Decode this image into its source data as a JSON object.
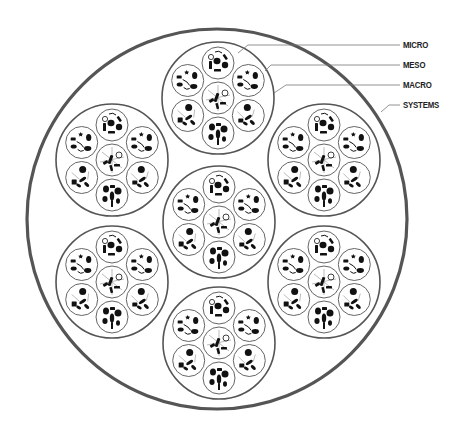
{
  "diagram": {
    "colors": {
      "systems_stroke": "#555555",
      "macro_stroke": "#555555",
      "micro_stroke": "#666666",
      "leader_stroke": "#777777",
      "glyph_fill": "#111111",
      "label_color": "#222222"
    },
    "systems": {
      "cx": 217,
      "cy": 219,
      "r": 190,
      "stroke_width": 3.2
    },
    "macro": {
      "r": 56,
      "stroke_width": 1.6,
      "centers": [
        {
          "name": "macro-top",
          "cx": 218,
          "cy": 98
        },
        {
          "name": "macro-upper-left",
          "cx": 112,
          "cy": 160
        },
        {
          "name": "macro-upper-right",
          "cx": 324,
          "cy": 160
        },
        {
          "name": "macro-center",
          "cx": 219,
          "cy": 222
        },
        {
          "name": "macro-lower-left",
          "cx": 112,
          "cy": 282
        },
        {
          "name": "macro-lower-right",
          "cx": 324,
          "cy": 282
        },
        {
          "name": "macro-bottom",
          "cx": 219,
          "cy": 343
        }
      ]
    },
    "meso": {
      "r": 16,
      "ring_distance": 35,
      "stroke_width": 1.0,
      "slots": [
        {
          "name": "meso-center",
          "angle": null
        },
        {
          "name": "meso-top",
          "angle": -90
        },
        {
          "name": "meso-upper-right",
          "angle": -30
        },
        {
          "name": "meso-lower-right",
          "angle": 30
        },
        {
          "name": "meso-bottom",
          "angle": 90
        },
        {
          "name": "meso-lower-left",
          "angle": 150
        },
        {
          "name": "meso-upper-left",
          "angle": 210
        }
      ]
    },
    "glyph_patterns": [
      [
        {
          "t": "line",
          "x1": -10,
          "y1": -8,
          "x2": 10,
          "y2": 8
        },
        {
          "t": "line",
          "x1": 0,
          "y1": -13,
          "x2": 0,
          "y2": 13
        },
        {
          "t": "line",
          "x1": -12,
          "y1": 2,
          "x2": 12,
          "y2": -3
        },
        {
          "t": "rect",
          "x": -3,
          "y": -5,
          "w": 3,
          "h": 9,
          "rot": 20
        },
        {
          "t": "rect",
          "x": -9,
          "y": 1,
          "w": 5,
          "h": 3,
          "rot": -30
        },
        {
          "t": "rect",
          "x": 2,
          "y": 4,
          "w": 6,
          "h": 2.5,
          "rot": 0
        },
        {
          "t": "ring",
          "cx": 7,
          "cy": -5,
          "r": 3
        },
        {
          "t": "rect",
          "x": -2,
          "y": 5,
          "w": 2.5,
          "h": 6,
          "rot": -15
        }
      ],
      [
        {
          "t": "ring",
          "cx": -7,
          "cy": -6,
          "r": 2.6
        },
        {
          "t": "arc",
          "d": "M-3,-11 Q1,-13 4,-10"
        },
        {
          "t": "rect",
          "x": 6,
          "y": -9,
          "w": 2.5,
          "h": 6,
          "rot": -35
        },
        {
          "t": "rect",
          "x": -9,
          "y": -2,
          "w": 3,
          "h": 8,
          "rot": 0
        },
        {
          "t": "blob",
          "cx": -1,
          "cy": -2,
          "rx": 3.5,
          "ry": 3.2
        },
        {
          "t": "circle",
          "cx": 7,
          "cy": 2,
          "r": 3.2
        },
        {
          "t": "rect",
          "x": -4,
          "y": 6,
          "w": 7,
          "h": 2.6,
          "rot": 0
        }
      ],
      [
        {
          "t": "rect",
          "x": -11,
          "y": -5,
          "w": 5,
          "h": 3,
          "rot": 0
        },
        {
          "t": "star",
          "cx": -1,
          "cy": -8,
          "r": 2.6
        },
        {
          "t": "blob",
          "cx": 7,
          "cy": -5,
          "rx": 2.6,
          "ry": 3.6
        },
        {
          "t": "arc",
          "d": "M-5,-1 Q0,1 2,5"
        },
        {
          "t": "blob",
          "cx": -8,
          "cy": 4,
          "rx": 3,
          "ry": 2
        },
        {
          "t": "blob",
          "cx": 6,
          "cy": 6,
          "rx": 3.6,
          "ry": 2.4
        },
        {
          "t": "arc",
          "d": "M-4,7 Q-1,10 2,8"
        }
      ],
      [
        {
          "t": "circle",
          "cx": -1,
          "cy": -8,
          "r": 3.5
        },
        {
          "t": "line",
          "x1": -11,
          "y1": -4,
          "x2": -4,
          "y2": 3
        },
        {
          "t": "line",
          "x1": 6,
          "y1": -6,
          "x2": 4,
          "y2": 1
        },
        {
          "t": "rect",
          "x": -10,
          "y": 3,
          "w": 5,
          "h": 4,
          "rot": 0
        },
        {
          "t": "blob",
          "cx": 0,
          "cy": 2,
          "rx": 4,
          "ry": 1.6,
          "rot": -35
        },
        {
          "t": "blob",
          "cx": 4,
          "cy": 7,
          "rx": 3,
          "ry": 1.6,
          "rot": 40
        },
        {
          "t": "blob",
          "cx": -3,
          "cy": 8,
          "rx": 2.6,
          "ry": 1.5,
          "rot": 30
        }
      ],
      [
        {
          "t": "blob",
          "cx": -6,
          "cy": -6,
          "rx": 3,
          "ry": 3.5
        },
        {
          "t": "rect",
          "x": -2,
          "y": -10,
          "w": 5,
          "h": 3,
          "rot": 0
        },
        {
          "t": "circle",
          "cx": 6,
          "cy": -4,
          "r": 3.5
        },
        {
          "t": "blob",
          "cx": 0,
          "cy": 1,
          "rx": 2.2,
          "ry": 4.5
        },
        {
          "t": "blob",
          "cx": -7,
          "cy": 4,
          "rx": 2.6,
          "ry": 3
        },
        {
          "t": "rect",
          "x": -1,
          "y": 5,
          "w": 2,
          "h": 7,
          "rot": 0
        },
        {
          "t": "blob",
          "cx": 6,
          "cy": 6,
          "rx": 2,
          "ry": 2.8
        }
      ],
      [
        {
          "t": "circle",
          "cx": 1,
          "cy": -8,
          "r": 3.5
        },
        {
          "t": "line",
          "x1": -10,
          "y1": -5,
          "x2": -2,
          "y2": 2
        },
        {
          "t": "line",
          "x1": 7,
          "y1": -6,
          "x2": 6,
          "y2": 2
        },
        {
          "t": "rect",
          "x": -10,
          "y": 2,
          "w": 5,
          "h": 5,
          "rot": 0
        },
        {
          "t": "blob",
          "cx": 1,
          "cy": 2,
          "rx": 4,
          "ry": 1.6,
          "rot": -35
        },
        {
          "t": "blob",
          "cx": 5,
          "cy": 7,
          "rx": 3,
          "ry": 1.6,
          "rot": 40
        },
        {
          "t": "blob",
          "cx": -3,
          "cy": 8,
          "rx": 2.6,
          "ry": 1.5,
          "rot": 30
        }
      ],
      [
        {
          "t": "rect",
          "x": -11,
          "y": -5,
          "w": 5,
          "h": 3,
          "rot": 0
        },
        {
          "t": "star",
          "cx": -1,
          "cy": -8,
          "r": 2.6
        },
        {
          "t": "blob",
          "cx": 7,
          "cy": -5,
          "rx": 2.6,
          "ry": 3.6
        },
        {
          "t": "arc",
          "d": "M-5,-1 Q0,1 2,5"
        },
        {
          "t": "blob",
          "cx": -8,
          "cy": 4,
          "rx": 3,
          "ry": 2
        },
        {
          "t": "blob",
          "cx": 6,
          "cy": 6,
          "rx": 3.6,
          "ry": 2.4
        },
        {
          "t": "arc",
          "d": "M-4,7 Q-1,10 2,8"
        }
      ]
    ],
    "labels": [
      {
        "id": "micro",
        "text": "MICRO",
        "x": 403,
        "y": 45,
        "leader": [
          [
            238,
            53
          ],
          [
            248,
            45
          ],
          [
            400,
            45
          ]
        ]
      },
      {
        "id": "meso",
        "text": "MESO",
        "x": 403,
        "y": 65,
        "leader": [
          [
            265,
            71
          ],
          [
            271,
            65
          ],
          [
            400,
            65
          ]
        ]
      },
      {
        "id": "macro",
        "text": "MACRO",
        "x": 403,
        "y": 85,
        "leader": [
          [
            274,
            93
          ],
          [
            286,
            85
          ],
          [
            400,
            85
          ]
        ]
      },
      {
        "id": "systems",
        "text": "SYSTEMS",
        "x": 403,
        "y": 105,
        "leader": [
          [
            381,
            112
          ],
          [
            389,
            105
          ],
          [
            400,
            105
          ]
        ]
      }
    ]
  }
}
